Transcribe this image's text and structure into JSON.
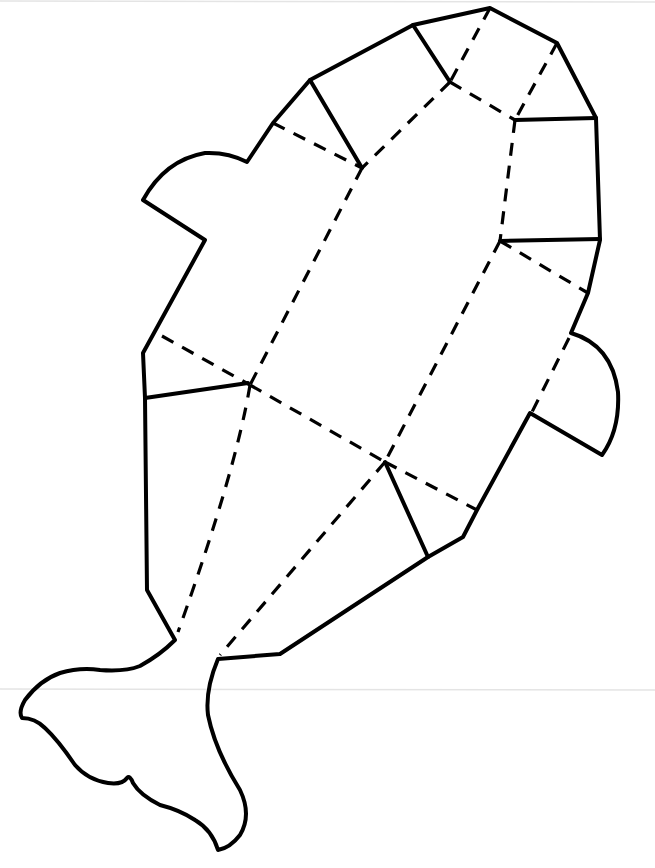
{
  "figure": {
    "background_color": "#ffffff",
    "line_color": "#000000",
    "scan_line_color": "#e4e4e4",
    "legend": {
      "solid": "cut line",
      "dashed": "fold line"
    }
  },
  "scan_lines": [
    {
      "x1": 0,
      "y1": 1,
      "x2": 655,
      "y2": 2
    },
    {
      "x1": 0,
      "y1": 689,
      "x2": 655,
      "y2": 690
    }
  ],
  "outline": {
    "body_path": "M 490 8 L 557 43 L 596 118 L 600 240 L 588 293 L 571 333 Q 612 345 618 392 Q 620 430 602 455 L 530 413 L 477 510 L 463 537 L 428 557 L 280 654 L 218 659 Q 205 690 208 715 Q 215 750 240 790 Q 252 815 240 835 Q 230 848 218 850 Q 212 830 195 820 Q 180 810 160 805 Q 140 795 133 783 Q 130 775 127 778 Q 122 785 108 783 Q 88 780 75 765 Q 58 740 45 728 Q 35 718 22 718 Q 18 712 25 700 Q 40 680 60 673 Q 80 667 100 670 Q 125 672 140 666 Q 160 655 175 640 L 147 590 L 145 398 L 143 353 L 205 240 L 143 200 Q 165 160 205 153 Q 228 152 247 162 L 273 123 L 310 80 L 413 25 Z"
  },
  "solid_lines": [
    {
      "name": "cut-upper-left-flap",
      "x1": 310,
      "y1": 80,
      "x2": 362,
      "y2": 168
    },
    {
      "name": "cut-top-flap",
      "x1": 413,
      "y1": 25,
      "x2": 450,
      "y2": 82
    },
    {
      "name": "cut-right-upper",
      "x1": 515,
      "y1": 120,
      "x2": 596,
      "y2": 118
    },
    {
      "name": "cut-right-lower",
      "x1": 500,
      "y1": 241,
      "x2": 600,
      "y2": 239
    },
    {
      "name": "cut-right-side-inner",
      "x1": 515,
      "y1": 120,
      "x2": 515,
      "y2": 120
    },
    {
      "name": "cut-left-mid",
      "x1": 145,
      "y1": 398,
      "x2": 248,
      "y2": 383
    },
    {
      "name": "cut-bottom-flap",
      "x1": 385,
      "y1": 462,
      "x2": 428,
      "y2": 557
    }
  ],
  "dashed_lines": [
    {
      "name": "fold-left-top",
      "x1": 273,
      "y1": 123,
      "x2": 362,
      "y2": 168
    },
    {
      "name": "fold-top-to-a",
      "x1": 450,
      "y1": 82,
      "x2": 362,
      "y2": 168
    },
    {
      "name": "fold-top-peak",
      "x1": 490,
      "y1": 8,
      "x2": 450,
      "y2": 82
    },
    {
      "name": "fold-e-to-f",
      "x1": 450,
      "y1": 82,
      "x2": 515,
      "y2": 120
    },
    {
      "name": "fold-f-to-right-top",
      "x1": 557,
      "y1": 43,
      "x2": 515,
      "y2": 120
    },
    {
      "name": "fold-f-to-b",
      "x1": 515,
      "y1": 120,
      "x2": 500,
      "y2": 241
    },
    {
      "name": "fold-b-to-right-edge",
      "x1": 500,
      "y1": 241,
      "x2": 588,
      "y2": 293
    },
    {
      "name": "fold-a-to-c",
      "x1": 362,
      "y1": 168,
      "x2": 250,
      "y2": 385
    },
    {
      "name": "fold-b-to-d",
      "x1": 500,
      "y1": 241,
      "x2": 385,
      "y2": 462
    },
    {
      "name": "fold-left-edge-to-c",
      "x1": 162,
      "y1": 336,
      "x2": 250,
      "y2": 385
    },
    {
      "name": "fold-c-to-d",
      "x1": 250,
      "y1": 385,
      "x2": 385,
      "y2": 462
    },
    {
      "name": "fold-d-to-right-edge",
      "x1": 385,
      "y1": 462,
      "x2": 477,
      "y2": 510
    },
    {
      "name": "fold-right-fin-base",
      "x1": 569,
      "y1": 338,
      "x2": 532,
      "y2": 412
    },
    {
      "name": "fold-d-to-tail",
      "x1": 385,
      "y1": 462,
      "x2": 220,
      "y2": 655
    }
  ],
  "dashed_paths": [
    {
      "name": "fold-c-to-tail-left",
      "d": "M 250 385 Q 236 470 178 632"
    }
  ],
  "nodes": [
    {
      "name": "node-a",
      "x": 362,
      "y": 168
    },
    {
      "name": "node-b",
      "x": 500,
      "y": 241
    },
    {
      "name": "node-c",
      "x": 250,
      "y": 385
    },
    {
      "name": "node-d",
      "x": 385,
      "y": 462
    },
    {
      "name": "node-e",
      "x": 450,
      "y": 82
    },
    {
      "name": "node-f",
      "x": 515,
      "y": 120
    }
  ]
}
